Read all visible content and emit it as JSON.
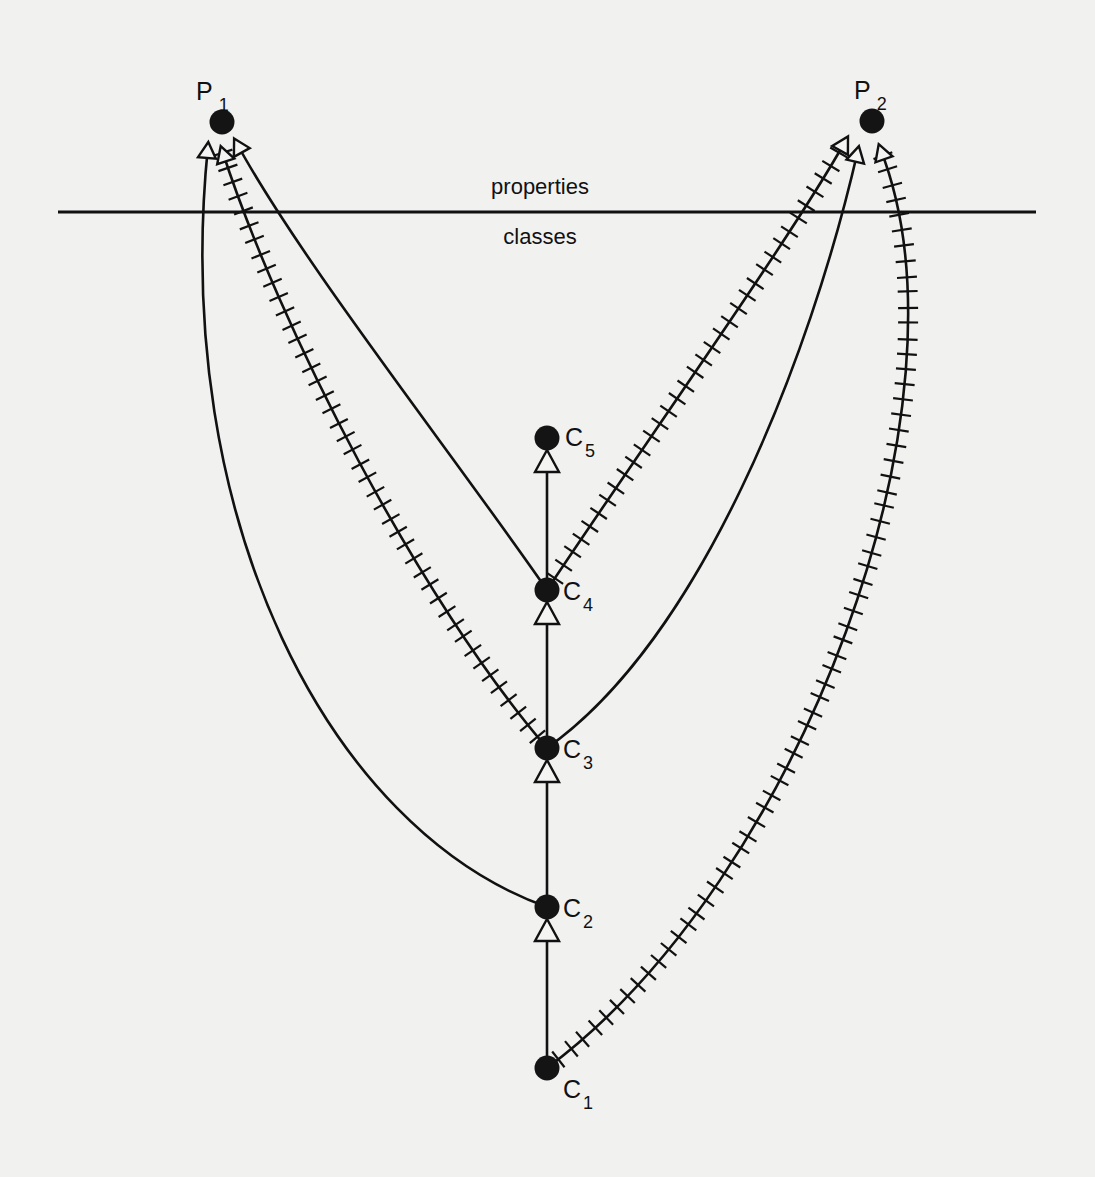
{
  "diagram": {
    "regions": {
      "upper": "properties",
      "lower": "classes"
    },
    "properties": [
      {
        "id": "P1",
        "letter": "P",
        "sub": "1"
      },
      {
        "id": "P2",
        "letter": "P",
        "sub": "2"
      }
    ],
    "classes": [
      {
        "id": "C1",
        "letter": "C",
        "sub": "1"
      },
      {
        "id": "C2",
        "letter": "C",
        "sub": "2"
      },
      {
        "id": "C3",
        "letter": "C",
        "sub": "3"
      },
      {
        "id": "C4",
        "letter": "C",
        "sub": "4"
      },
      {
        "id": "C5",
        "letter": "C",
        "sub": "5"
      }
    ],
    "subclass_edges": [
      {
        "from": "C1",
        "to": "C2"
      },
      {
        "from": "C2",
        "to": "C3"
      },
      {
        "from": "C3",
        "to": "C4"
      },
      {
        "from": "C4",
        "to": "C5"
      }
    ],
    "property_edges": [
      {
        "from": "C2",
        "to": "P1",
        "style": "plain"
      },
      {
        "from": "C3",
        "to": "P1",
        "style": "hatched"
      },
      {
        "from": "C4",
        "to": "P1",
        "style": "plain"
      },
      {
        "from": "C3",
        "to": "P2",
        "style": "plain"
      },
      {
        "from": "C4",
        "to": "P2",
        "style": "hatched"
      },
      {
        "from": "C1",
        "to": "P2",
        "style": "hatched"
      }
    ],
    "legend_note": "plain edge vs hatched (crossed) edge"
  }
}
